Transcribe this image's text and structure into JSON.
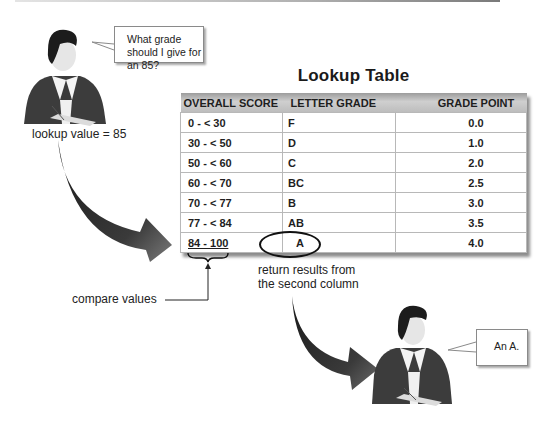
{
  "title": "Lookup Table",
  "top_speech": "What grade should I give for an 85?",
  "lookup_label": "lookup value = 85",
  "table": {
    "headers": [
      "OVERALL SCORE",
      "LETTER GRADE",
      "GRADE POINT"
    ],
    "rows": [
      [
        "0 - < 30",
        "F",
        "0.0"
      ],
      [
        "30 - < 50",
        "D",
        "1.0"
      ],
      [
        "50 - < 60",
        "C",
        "2.0"
      ],
      [
        "60 - < 70",
        "BC",
        "2.5"
      ],
      [
        "70 - < 77",
        "B",
        "3.0"
      ],
      [
        "77 - < 84",
        "AB",
        "3.5"
      ],
      [
        "84 - 100",
        "A",
        "4.0"
      ]
    ],
    "highlighted_row": 6
  },
  "compare_label": "compare values",
  "return_label_line1": "return results from",
  "return_label_line2": "the second column",
  "bottom_speech": "An A.",
  "colors": {
    "header_gray": "#bdbdbd",
    "arrow_dark": "#2a2a2a",
    "cell_border": "#b8b8b8"
  }
}
